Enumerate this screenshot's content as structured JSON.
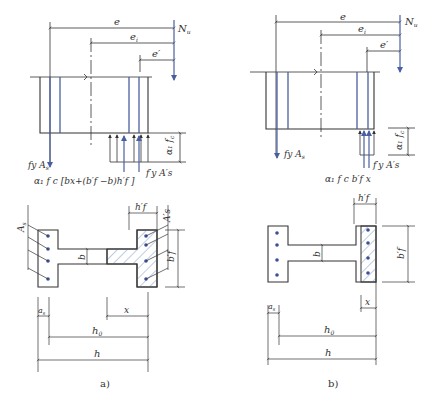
{
  "figure": {
    "panel_a": {
      "caption": "a)",
      "labels": {
        "e": "e",
        "ei": "e",
        "ei_sub": "i",
        "e_prime": "e′",
        "Nu": "N",
        "Nu_sub": "u",
        "fyAs": "f",
        "fyAs_rest": "y A",
        "fyAs_sub": "s",
        "alpha_fc": "α₁ f",
        "alpha_fc_sub": "c",
        "fyAs_prime": "f′y A′s",
        "compression_formula": "α₁ f c [bx+(b′f −b)h′f ]",
        "As": "A",
        "As_sub": "s",
        "As_prime": "A′s",
        "hf_prime": "h′f",
        "bf_prime": "b′f",
        "b": "b",
        "as": "a",
        "as_sub": "s",
        "x": "x",
        "h0": "h",
        "h0_sub": "0",
        "h": "h"
      }
    },
    "panel_b": {
      "caption": "b)",
      "labels": {
        "e": "e",
        "ei": "e",
        "ei_sub": "i",
        "e_prime": "e′",
        "Nu": "N",
        "Nu_sub": "u",
        "fyAs": "f",
        "fyAs_rest": "y A",
        "fyAs_sub": "s",
        "alpha_fc": "α₁ f",
        "alpha_fc_sub": "c",
        "fyAs_prime": "f′y A′s",
        "compression_formula": "α₁ f c b′f x",
        "hf_prime": "h′f",
        "bf_prime": "b′f",
        "b": "b",
        "as": "a",
        "as_sub": "s",
        "x": "x",
        "h0": "h",
        "h0_sub": "0",
        "h": "h"
      }
    },
    "colors": {
      "line": "#333333",
      "rebar": "#4a5fa0",
      "hatch": "#7f9ac8",
      "dot": "#3d4f9a"
    }
  }
}
